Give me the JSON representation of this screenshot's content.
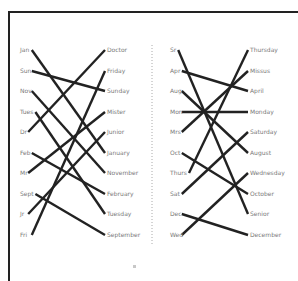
{
  "diagram": {
    "type": "matching-lines",
    "colors": {
      "frame": "#222222",
      "line": "#222222",
      "label": "#7a7a7a",
      "divider": "#aaaaaa"
    },
    "row_y": [
      50,
      71,
      91,
      112,
      132,
      153,
      173,
      194,
      214,
      235
    ],
    "panels": [
      {
        "name": "left-panel",
        "left_labels": [
          "Jan",
          "Sun",
          "Nov",
          "Tues",
          "Dr",
          "Feb",
          "Mr",
          "Sept",
          "Jr",
          "Fri"
        ],
        "right_labels": [
          "Doctor",
          "Friday",
          "Sunday",
          "Mister",
          "Junior",
          "January",
          "November",
          "February",
          "Tuesday",
          "September"
        ],
        "connections": [
          [
            0,
            5
          ],
          [
            1,
            2
          ],
          [
            2,
            6
          ],
          [
            3,
            8
          ],
          [
            4,
            0
          ],
          [
            5,
            7
          ],
          [
            6,
            3
          ],
          [
            7,
            9
          ],
          [
            8,
            4
          ],
          [
            9,
            1
          ]
        ]
      },
      {
        "name": "right-panel",
        "left_labels": [
          "Sr",
          "Apr",
          "Aug",
          "Mon",
          "Mrs",
          "Oct",
          "Thurs",
          "Sat",
          "Dec",
          "Wed"
        ],
        "right_labels": [
          "Thursday",
          "Missus",
          "April",
          "Monday",
          "Saturday",
          "August",
          "Wednesday",
          "October",
          "Senior",
          "December"
        ],
        "connections": [
          [
            0,
            8
          ],
          [
            1,
            2
          ],
          [
            2,
            5
          ],
          [
            3,
            3
          ],
          [
            4,
            1
          ],
          [
            5,
            7
          ],
          [
            6,
            0
          ],
          [
            7,
            4
          ],
          [
            8,
            9
          ],
          [
            9,
            6
          ]
        ]
      }
    ],
    "footer_mark": "▫"
  }
}
